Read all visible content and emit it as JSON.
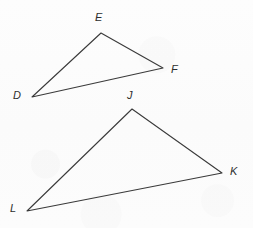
{
  "figure": {
    "background_color": "#fcfcfc",
    "stroke_color": "#3a3a3a",
    "label_color": "#2e2e2e",
    "stroke_width": 1.1,
    "width": 253,
    "height": 228
  },
  "shapes": [
    {
      "name": "triangle-def",
      "type": "triangle",
      "vertices": [
        {
          "label": "D",
          "x": 32,
          "y": 97,
          "label_x": 13,
          "label_y": 90
        },
        {
          "label": "E",
          "x": 101,
          "y": 33,
          "label_x": 95,
          "label_y": 12
        },
        {
          "label": "F",
          "x": 163,
          "y": 68,
          "label_x": 171,
          "label_y": 64
        }
      ],
      "edges": [
        {
          "name": "edge-DE",
          "from": "D",
          "to": "E"
        },
        {
          "name": "edge-EF",
          "from": "E",
          "to": "F"
        },
        {
          "name": "edge-FD",
          "from": "F",
          "to": "D"
        }
      ]
    },
    {
      "name": "triangle-jkl",
      "type": "triangle",
      "vertices": [
        {
          "label": "J",
          "x": 132,
          "y": 109,
          "label_x": 127,
          "label_y": 90
        },
        {
          "label": "K",
          "x": 222,
          "y": 173,
          "label_x": 230,
          "label_y": 166
        },
        {
          "label": "L",
          "x": 27,
          "y": 211,
          "label_x": 10,
          "label_y": 203
        }
      ],
      "edges": [
        {
          "name": "edge-JK",
          "from": "J",
          "to": "K"
        },
        {
          "name": "edge-KL",
          "from": "K",
          "to": "L"
        },
        {
          "name": "edge-LJ",
          "from": "L",
          "to": "J"
        }
      ]
    }
  ]
}
